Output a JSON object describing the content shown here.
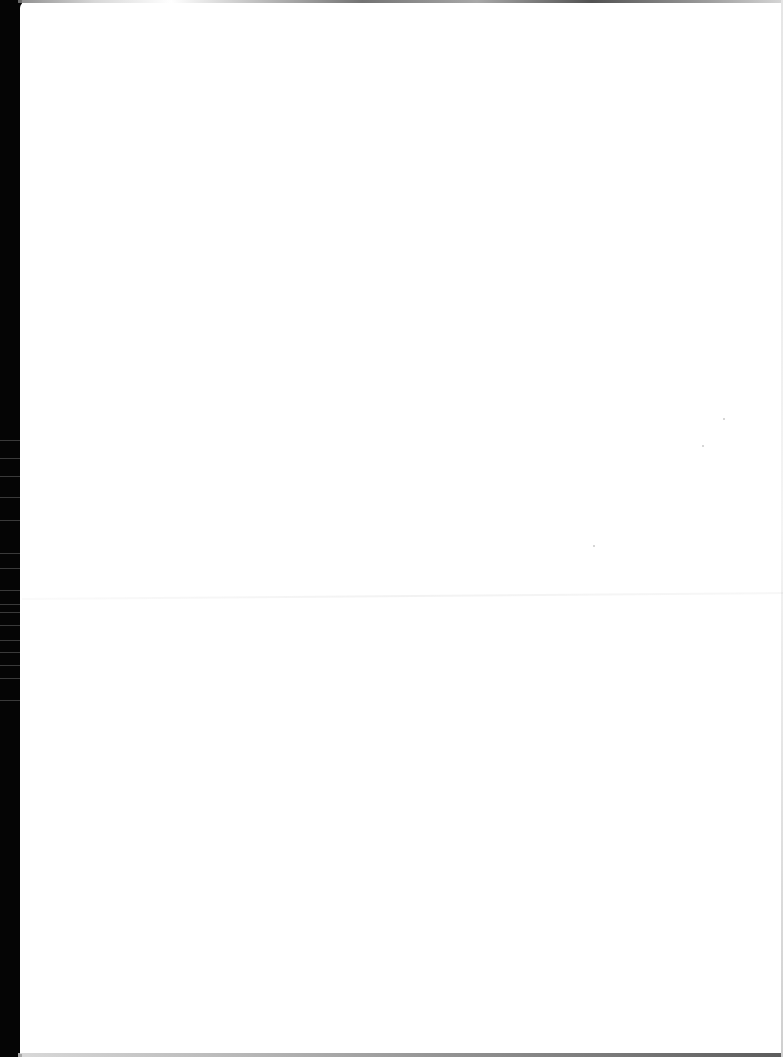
{
  "document": {
    "type": "scanned-page",
    "content": "",
    "is_blank": true
  },
  "colors": {
    "paper": "#ffffff",
    "scan_edge": "#050505"
  }
}
